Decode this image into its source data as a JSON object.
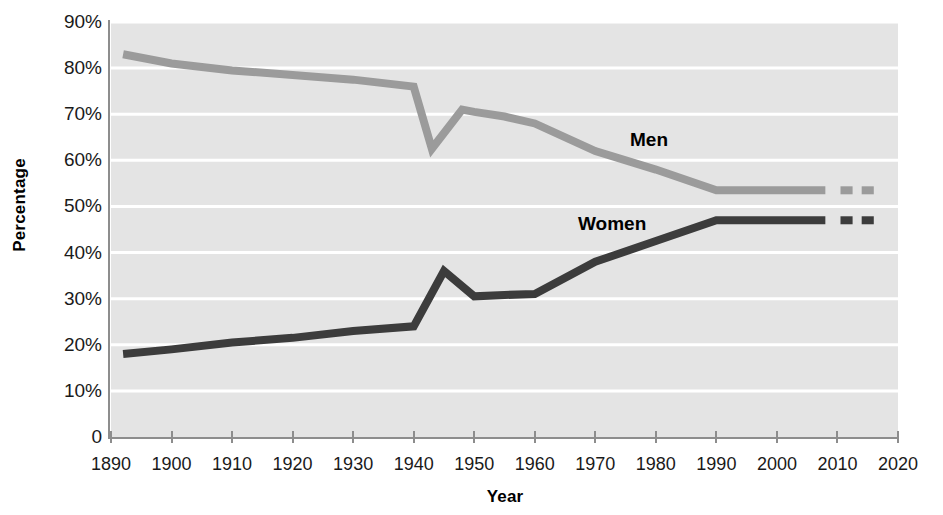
{
  "chart_data": {
    "type": "line",
    "title": "",
    "xlabel": "Year",
    "ylabel": "Percentage",
    "xlim": [
      1890,
      2020
    ],
    "ylim": [
      0,
      90
    ],
    "grid": true,
    "legend_position": "inline-annotations",
    "x_tick_labels": [
      "1890",
      "1900",
      "1910",
      "1920",
      "1930",
      "1940",
      "1950",
      "1960",
      "1970",
      "1980",
      "1990",
      "2000",
      "2010",
      "2020"
    ],
    "y_tick_labels": [
      "90%",
      "80%",
      "70%",
      "60%",
      "50%",
      "40%",
      "30%",
      "20%",
      "10%",
      "0"
    ],
    "y_tick_values": [
      90,
      80,
      70,
      60,
      50,
      40,
      30,
      20,
      10,
      0
    ],
    "series": [
      {
        "name": "Men",
        "color": "#9b9b9b",
        "label_text": "Men",
        "points": [
          [
            1892,
            83.0
          ],
          [
            1900,
            81.0
          ],
          [
            1910,
            79.5
          ],
          [
            1920,
            78.5
          ],
          [
            1930,
            77.5
          ],
          [
            1940,
            76.0
          ],
          [
            1943,
            62.5
          ],
          [
            1948,
            71.0
          ],
          [
            1950,
            70.5
          ],
          [
            1955,
            69.5
          ],
          [
            1960,
            68.0
          ],
          [
            1970,
            62.0
          ],
          [
            1980,
            58.0
          ],
          [
            1990,
            53.5
          ],
          [
            2008,
            53.5
          ]
        ],
        "dashes": [
          [
            2010.5,
            2012.5,
            53.5
          ],
          [
            2014.0,
            2016.0,
            53.5
          ]
        ]
      },
      {
        "name": "Women",
        "color": "#3c3c3c",
        "label_text": "Women",
        "points": [
          [
            1892,
            18.0
          ],
          [
            1900,
            19.0
          ],
          [
            1910,
            20.5
          ],
          [
            1920,
            21.5
          ],
          [
            1930,
            23.0
          ],
          [
            1940,
            24.0
          ],
          [
            1945,
            36.0
          ],
          [
            1950,
            30.5
          ],
          [
            1955,
            30.8
          ],
          [
            1960,
            31.0
          ],
          [
            1970,
            38.0
          ],
          [
            1980,
            42.5
          ],
          [
            1990,
            47.0
          ],
          [
            2008,
            47.0
          ]
        ],
        "dashes": [
          [
            2010.5,
            2012.5,
            47.0
          ],
          [
            2014.0,
            2016.0,
            47.0
          ]
        ]
      }
    ]
  },
  "axes": {
    "y_title": "Percentage",
    "x_title": "Year"
  },
  "colors": {
    "plot_background": "#e4e4e4",
    "gridline": "#ffffff",
    "axis": "#8d8d8d",
    "men_line": "#9b9b9b",
    "women_line": "#3c3c3c",
    "text": "#1a1a1a"
  }
}
